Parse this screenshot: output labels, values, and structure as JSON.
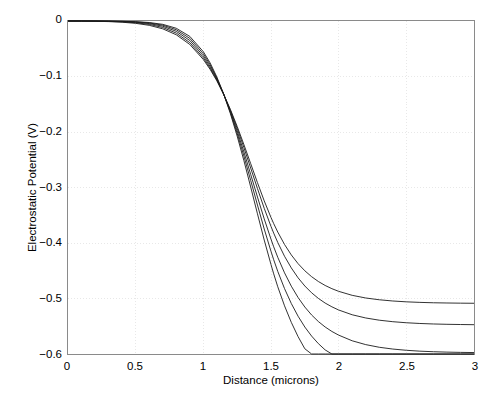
{
  "chart_data": {
    "type": "line",
    "title": "",
    "xlabel": "Distance (microns)",
    "ylabel": "Electrostatic Potential (V)",
    "xlim": [
      0,
      3
    ],
    "ylim": [
      -0.6,
      0
    ],
    "xticks": [
      "0",
      "0.5",
      "1",
      "1.5",
      "2",
      "2.5",
      "3"
    ],
    "xtick_values": [
      0,
      0.5,
      1,
      1.5,
      2,
      2.5,
      3
    ],
    "yticks": [
      "0",
      "−0.1",
      "−0.2",
      "−0.3",
      "−0.4",
      "−0.5",
      "−0.6"
    ],
    "ytick_values": [
      0,
      -0.1,
      -0.2,
      -0.3,
      -0.4,
      -0.5,
      -0.6
    ],
    "grid": true,
    "grid_style": "dotted",
    "grid_color": "#e8e8e8",
    "legend": false,
    "legend_position": "none",
    "line_color": "#1a1a1a",
    "line_width": 0.9,
    "axes_color": "#8a8a8a",
    "background": "#ffffff",
    "crossing_point": [
      1.52,
      -0.295
    ],
    "plateau_left": 0.0,
    "plateau_right": -0.578,
    "series": [
      {
        "name": "curve-1",
        "x": [
          0,
          0.1,
          0.2,
          0.3,
          0.4,
          0.5,
          0.6,
          0.7,
          0.8,
          0.9,
          1.0,
          1.05,
          1.1,
          1.15,
          1.2,
          1.25,
          1.3,
          1.35,
          1.4,
          1.45,
          1.5,
          1.52,
          1.55,
          1.6,
          1.65,
          1.7,
          1.75,
          1.8,
          1.85,
          1.9,
          1.95,
          2.0,
          2.1,
          2.2,
          2.3,
          2.4,
          2.5,
          2.6,
          2.7,
          2.8,
          2.9,
          3.0
        ],
        "y": [
          0,
          -0.0002,
          -0.0005,
          -0.0011,
          -0.0022,
          -0.0042,
          -0.0078,
          -0.0141,
          -0.0248,
          -0.0423,
          -0.0694,
          -0.0871,
          -0.1079,
          -0.132,
          -0.1594,
          -0.1899,
          -0.2228,
          -0.257,
          -0.2913,
          -0.3241,
          -0.3541,
          -0.3651,
          -0.3803,
          -0.4027,
          -0.4215,
          -0.4372,
          -0.4501,
          -0.4607,
          -0.4694,
          -0.4765,
          -0.4823,
          -0.4871,
          -0.4943,
          -0.4991,
          -0.5023,
          -0.5045,
          -0.506,
          -0.507,
          -0.5077,
          -0.5081,
          -0.5084,
          -0.5086
        ]
      },
      {
        "name": "curve-2",
        "x": [
          0,
          0.1,
          0.2,
          0.3,
          0.4,
          0.5,
          0.6,
          0.7,
          0.8,
          0.9,
          1.0,
          1.05,
          1.1,
          1.15,
          1.2,
          1.25,
          1.3,
          1.35,
          1.4,
          1.45,
          1.5,
          1.52,
          1.55,
          1.6,
          1.65,
          1.7,
          1.75,
          1.8,
          1.85,
          1.9,
          1.95,
          2.0,
          2.1,
          2.2,
          2.3,
          2.4,
          2.5,
          2.6,
          2.7,
          2.8,
          2.9,
          3.0
        ],
        "y": [
          0,
          -0.0001,
          -0.0003,
          -0.0007,
          -0.0015,
          -0.0031,
          -0.0061,
          -0.0117,
          -0.0218,
          -0.039,
          -0.0664,
          -0.0847,
          -0.1065,
          -0.1319,
          -0.1609,
          -0.1932,
          -0.2283,
          -0.265,
          -0.3019,
          -0.3375,
          -0.3702,
          -0.3823,
          -0.3991,
          -0.4239,
          -0.4449,
          -0.4627,
          -0.4775,
          -0.4897,
          -0.4998,
          -0.5082,
          -0.515,
          -0.5207,
          -0.5293,
          -0.5351,
          -0.5391,
          -0.5418,
          -0.5437,
          -0.545,
          -0.5459,
          -0.5465,
          -0.5469,
          -0.5472
        ]
      },
      {
        "name": "curve-3",
        "x": [
          0,
          0.1,
          0.2,
          0.3,
          0.4,
          0.5,
          0.6,
          0.7,
          0.8,
          0.9,
          1.0,
          1.05,
          1.1,
          1.15,
          1.2,
          1.25,
          1.3,
          1.35,
          1.4,
          1.45,
          1.5,
          1.52,
          1.55,
          1.6,
          1.65,
          1.7,
          1.75,
          1.8,
          1.85,
          1.9,
          1.95,
          2.0,
          2.1,
          2.2,
          2.3,
          2.4,
          2.5,
          2.6,
          2.7,
          2.8,
          2.9,
          3.0
        ],
        "y": [
          0,
          -5e-05,
          -0.0002,
          -0.0004,
          -0.001,
          -0.0022,
          -0.0046,
          -0.0094,
          -0.0186,
          -0.0351,
          -0.0628,
          -0.0818,
          -0.1048,
          -0.1318,
          -0.163,
          -0.198,
          -0.2361,
          -0.2764,
          -0.3171,
          -0.3566,
          -0.3932,
          -0.4069,
          -0.4258,
          -0.4538,
          -0.4778,
          -0.4982,
          -0.5154,
          -0.5297,
          -0.5415,
          -0.5513,
          -0.5594,
          -0.566,
          -0.5762,
          -0.5831,
          -0.5879,
          -0.5911,
          -0.5933,
          -0.5949,
          -0.5959,
          -0.5966,
          -0.5971,
          -0.5974
        ]
      },
      {
        "name": "curve-4",
        "x": [
          0,
          0.1,
          0.2,
          0.3,
          0.4,
          0.5,
          0.6,
          0.7,
          0.8,
          0.9,
          1.0,
          1.05,
          1.1,
          1.15,
          1.2,
          1.25,
          1.3,
          1.35,
          1.4,
          1.45,
          1.5,
          1.52,
          1.55,
          1.6,
          1.65,
          1.7,
          1.75,
          1.8,
          1.85,
          1.9,
          1.95,
          2.0,
          2.1,
          2.2,
          2.3,
          2.4,
          2.5,
          2.6,
          2.7,
          2.8,
          2.9,
          3.0
        ],
        "y": [
          0,
          -3e-05,
          -0.0001,
          -0.0003,
          -0.0007,
          -0.0016,
          -0.0035,
          -0.0075,
          -0.0157,
          -0.0313,
          -0.059,
          -0.0786,
          -0.1028,
          -0.1315,
          -0.1648,
          -0.2024,
          -0.2435,
          -0.2872,
          -0.3316,
          -0.3748,
          -0.4151,
          -0.4302,
          -0.4512,
          -0.4822,
          -0.509,
          -0.5319,
          -0.5514,
          -0.5677,
          -0.5813,
          -0.5926,
          -0.602,
          -0.6097,
          -0.6217,
          -0.6299,
          -0.6356,
          -0.6395,
          -0.6422,
          -0.6441,
          -0.6454,
          -0.6463,
          -0.6469,
          -0.6473
        ]
      },
      {
        "name": "curve-5",
        "x": [
          0,
          0.1,
          0.2,
          0.3,
          0.4,
          0.5,
          0.6,
          0.7,
          0.8,
          0.9,
          1.0,
          1.05,
          1.1,
          1.15,
          1.2,
          1.25,
          1.3,
          1.35,
          1.4,
          1.45,
          1.5,
          1.52,
          1.55,
          1.6,
          1.65,
          1.7,
          1.75,
          1.8,
          1.85,
          1.9,
          1.95,
          2.0,
          2.1,
          2.2,
          2.3,
          2.4,
          2.5,
          2.6,
          2.7,
          2.8,
          2.9,
          3.0
        ],
        "y": [
          0,
          -2e-05,
          -8e-05,
          -0.0002,
          -0.0005,
          -0.0012,
          -0.0027,
          -0.006,
          -0.0131,
          -0.0277,
          -0.0553,
          -0.0755,
          -0.1009,
          -0.1313,
          -0.1669,
          -0.2073,
          -0.2517,
          -0.2991,
          -0.3474,
          -0.3947,
          -0.4389,
          -0.4556,
          -0.4789,
          -0.5132,
          -0.543,
          -0.5687,
          -0.5906,
          -0.609,
          -0.6244,
          -0.6372,
          -0.6479,
          -0.6568,
          -0.6705,
          -0.68,
          -0.6866,
          -0.6911,
          -0.6943,
          -0.6965,
          -0.698,
          -0.6991,
          -0.6998,
          -0.7003
        ]
      }
    ]
  }
}
